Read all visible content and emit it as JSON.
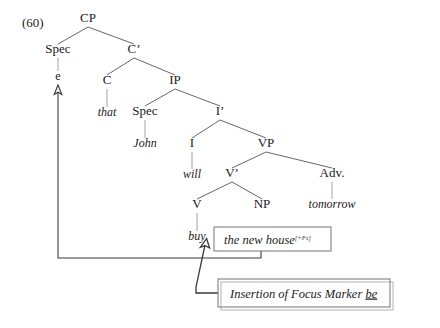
{
  "figure": {
    "example_number": "(60)",
    "caption_present": false
  },
  "tree": {
    "nodes": [
      {
        "id": "cp",
        "label": "CP",
        "x": 88,
        "y": 22
      },
      {
        "id": "spec1",
        "label": "Spec",
        "x": 58,
        "y": 53
      },
      {
        "id": "cbar",
        "label": "C’",
        "x": 134,
        "y": 53
      },
      {
        "id": "c",
        "label": "C",
        "x": 107,
        "y": 84
      },
      {
        "id": "ip",
        "label": "IP",
        "x": 175,
        "y": 84
      },
      {
        "id": "spec2",
        "label": "Spec",
        "x": 145,
        "y": 115
      },
      {
        "id": "ibar",
        "label": "I’",
        "x": 220,
        "y": 115
      },
      {
        "id": "i",
        "label": "I",
        "x": 192,
        "y": 147
      },
      {
        "id": "vp",
        "label": "VP",
        "x": 266,
        "y": 147
      },
      {
        "id": "vbar",
        "label": "V’",
        "x": 232,
        "y": 177
      },
      {
        "id": "adv",
        "label": "Adv.",
        "x": 332,
        "y": 177
      },
      {
        "id": "v",
        "label": "V",
        "x": 197,
        "y": 208
      },
      {
        "id": "np",
        "label": "NP",
        "x": 262,
        "y": 208
      }
    ],
    "branches": [
      {
        "from": "cp",
        "to": "spec1"
      },
      {
        "from": "cp",
        "to": "cbar"
      },
      {
        "from": "cbar",
        "to": "c"
      },
      {
        "from": "cbar",
        "to": "ip"
      },
      {
        "from": "ip",
        "to": "spec2"
      },
      {
        "from": "ip",
        "to": "ibar"
      },
      {
        "from": "ibar",
        "to": "i"
      },
      {
        "from": "ibar",
        "to": "vp"
      },
      {
        "from": "vp",
        "to": "vbar"
      },
      {
        "from": "vp",
        "to": "adv"
      },
      {
        "from": "vbar",
        "to": "v"
      },
      {
        "from": "vbar",
        "to": "np"
      }
    ],
    "terminals": [
      {
        "id": "t-e",
        "parent": "spec1",
        "text": "e",
        "x": 58,
        "y": 80,
        "style": "roman"
      },
      {
        "id": "t-that",
        "parent": "c",
        "text": "that",
        "x": 107,
        "y": 116,
        "style": "italic"
      },
      {
        "id": "t-john",
        "parent": "spec2",
        "text": "John",
        "x": 145,
        "y": 147,
        "style": "italic"
      },
      {
        "id": "t-will",
        "parent": "i",
        "text": "will",
        "x": 192,
        "y": 178,
        "style": "italic"
      },
      {
        "id": "t-tomorrow",
        "parent": "adv",
        "text": "tomorrow",
        "x": 332,
        "y": 208,
        "style": "italic"
      },
      {
        "id": "t-buy",
        "parent": "v",
        "text": "buy",
        "x": 197,
        "y": 240,
        "style": "italic"
      }
    ]
  },
  "np_box": {
    "text": "the new house",
    "feature": "[+Fs]",
    "x": 214,
    "y": 227,
    "width": 117,
    "height": 24
  },
  "rule_box": {
    "text_before": "Insertion of Focus Marker ",
    "underlined_word": "be",
    "x": 218,
    "y": 279,
    "width": 172,
    "height": 28
  },
  "annotations": {
    "movement_arrow_name": "np-to-spec-movement-arrow",
    "rule_arrow_name": "focus-marker-insertion-arrow"
  },
  "colors": {
    "background": "#ffffff",
    "text": "#222222",
    "branch": "#555555",
    "stem": "#999999",
    "arrow": "#3a3a3a",
    "box_border": "#808080"
  }
}
